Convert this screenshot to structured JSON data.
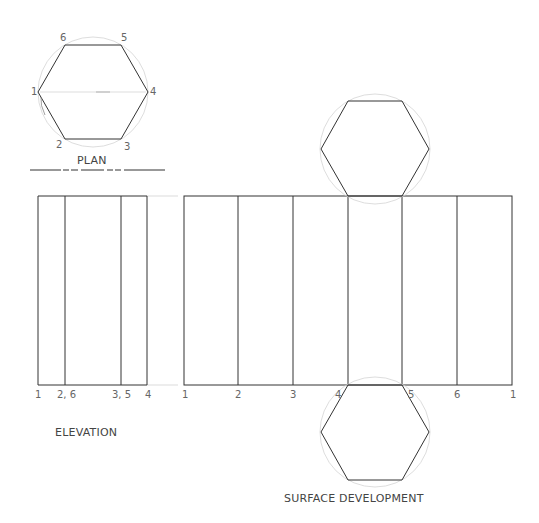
{
  "plan": {
    "title": "PLAN",
    "vertex_labels": [
      "1",
      "2",
      "3",
      "4",
      "5",
      "6"
    ]
  },
  "elevation": {
    "title": "ELEVATION",
    "base_labels": [
      "1",
      "2, 6",
      "3, 5",
      "4"
    ]
  },
  "development": {
    "title": "SURFACE DEVELOPMENT",
    "base_labels": [
      "1",
      "2",
      "3",
      "4",
      "5",
      "6",
      "1"
    ],
    "lower_labels": [
      "4",
      "5"
    ]
  },
  "colors": {
    "line": "#333333",
    "construction": "#cccccc",
    "label": "#666666"
  }
}
